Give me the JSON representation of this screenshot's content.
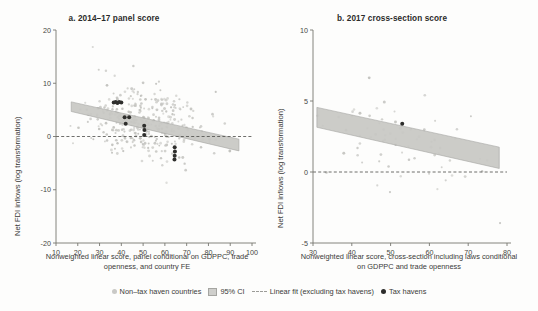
{
  "figure": {
    "ylabel": "Net FDI inflows (log transformation)"
  },
  "legend": {
    "items": [
      {
        "marker": "light-dot",
        "label": "Non–tax haven countries"
      },
      {
        "marker": "band",
        "label": "95% CI"
      },
      {
        "marker": "dashed-line",
        "label": "Linear fit (excluding tax havens)"
      },
      {
        "marker": "dark-dot",
        "label": "Tax havens"
      }
    ]
  },
  "chart_data": [
    {
      "type": "scatter",
      "panel": "a",
      "title": "a. 2014–17 panel score",
      "xlabel": "Nonweighted linear score, panel conditional on GDPPC, trade openness, and country FE",
      "ylabel": "Net FDI inflows (log transformation)",
      "xlim": [
        10,
        100
      ],
      "ylim": [
        -20,
        20
      ],
      "xticks": [
        10,
        20,
        30,
        40,
        50,
        60,
        70,
        80,
        90,
        100
      ],
      "yticks": [
        -20,
        -10,
        0,
        10,
        20
      ],
      "grid": false,
      "zero_line": 0,
      "fit": {
        "x": [
          17,
          94
        ],
        "y": [
          5.6,
          -1.6
        ],
        "ci_halfwidth": [
          0.9,
          1.1
        ]
      },
      "n_points": 330,
      "cloud": {
        "x_mean": 52,
        "x_sd": 15,
        "y_center_at_x": [
          17,
          5.0,
          94,
          -1.0
        ],
        "y_sd": 3.2,
        "x_min": 16,
        "x_max": 95
      },
      "tax_havens": [
        {
          "x": 36.5,
          "y": 6.4
        },
        {
          "x": 37.4,
          "y": 6.5
        },
        {
          "x": 38.2,
          "y": 6.3
        },
        {
          "x": 39.0,
          "y": 6.5
        },
        {
          "x": 40.0,
          "y": 6.4
        },
        {
          "x": 41.5,
          "y": 3.6
        },
        {
          "x": 43.6,
          "y": 3.6
        },
        {
          "x": 42.0,
          "y": 2.4
        },
        {
          "x": 50.5,
          "y": 2.0
        },
        {
          "x": 50.6,
          "y": 1.2
        },
        {
          "x": 50.5,
          "y": 0.3
        },
        {
          "x": 64.5,
          "y": -2.0
        },
        {
          "x": 64.6,
          "y": -2.8
        },
        {
          "x": 64.5,
          "y": -3.6
        },
        {
          "x": 64.4,
          "y": -4.3
        }
      ]
    },
    {
      "type": "scatter",
      "panel": "b",
      "title": "b. 2017 cross-section score",
      "xlabel": "Nonweighted linear score, cross-section including laws conditional on GDPPC and trade openness",
      "ylabel": "Net FDI inflows (log transformation)",
      "xlim": [
        30,
        80
      ],
      "ylim": [
        -5,
        10
      ],
      "xticks": [
        30,
        40,
        50,
        60,
        70,
        80
      ],
      "yticks": [
        -5,
        0,
        5,
        10
      ],
      "grid": false,
      "zero_line": 0,
      "fit": {
        "x": [
          31,
          78
        ],
        "y": [
          3.85,
          1.0
        ],
        "ci_halfwidth": [
          0.7,
          0.75
        ]
      },
      "n_points": 72,
      "cloud": {
        "x_mean": 53,
        "x_sd": 12,
        "y_center_at_x": [
          31,
          3.6,
          78,
          0.9
        ],
        "y_sd": 1.7,
        "x_min": 31,
        "x_max": 79
      },
      "tax_havens": [
        {
          "x": 53,
          "y": 3.4
        }
      ]
    }
  ]
}
